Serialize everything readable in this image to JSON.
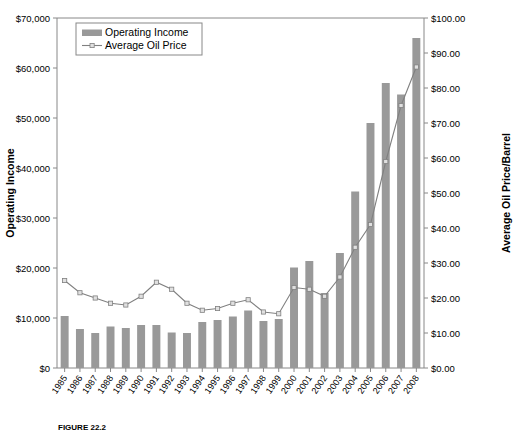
{
  "figure": {
    "caption": "FIGURE 22.2",
    "background_color": "#ffffff"
  },
  "chart_data": {
    "type": "bar",
    "title": "",
    "subtitle": "",
    "xlabel": "",
    "ylabel": "Operating Income",
    "y2label": "Average Oil Price/Barrel",
    "ylim": [
      0,
      70000
    ],
    "y2lim": [
      0,
      100
    ],
    "grid": false,
    "legend_position": "top-left",
    "categories": [
      "1985",
      "1986",
      "1987",
      "1988",
      "1989",
      "1990",
      "1991",
      "1992",
      "1993",
      "1994",
      "1995",
      "1996",
      "1997",
      "1998",
      "1999",
      "2000",
      "2001",
      "2002",
      "2003",
      "2004",
      "2005",
      "2006",
      "2007",
      "2008"
    ],
    "y_tick_labels": [
      "$0",
      "$10,000",
      "$20,000",
      "$30,000",
      "$40,000",
      "$50,000",
      "$60,000",
      "$70,000"
    ],
    "y_tick_values": [
      0,
      10000,
      20000,
      30000,
      40000,
      50000,
      60000,
      70000
    ],
    "y2_tick_labels": [
      "$0.00",
      "$10.00",
      "$20.00",
      "$30.00",
      "$40.00",
      "$50.00",
      "$60.00",
      "$70.00",
      "$80.00",
      "$90.00",
      "$100.00"
    ],
    "y2_tick_values": [
      0,
      10,
      20,
      30,
      40,
      50,
      60,
      70,
      80,
      90,
      100
    ],
    "series": [
      {
        "name": "Operating Income",
        "type": "bar",
        "axis": "left",
        "color": "#999999",
        "values": [
          10400,
          7800,
          7000,
          8300,
          8000,
          8600,
          8600,
          7100,
          7000,
          9200,
          9600,
          10300,
          11500,
          9400,
          9800,
          20100,
          21400,
          15000,
          23000,
          35300,
          49000,
          57000,
          54700,
          66000
        ]
      },
      {
        "name": "Average Oil Price",
        "type": "line",
        "axis": "right",
        "color": "#808080",
        "marker_color": "#e0e0e0",
        "values": [
          25.0,
          21.5,
          20.0,
          18.5,
          18.0,
          20.5,
          24.5,
          22.5,
          18.5,
          16.5,
          17.0,
          18.5,
          19.5,
          16.0,
          15.5,
          23.0,
          22.5,
          20.5,
          26.0,
          34.5,
          41.0,
          59.0,
          75.0,
          86.0
        ]
      }
    ]
  },
  "legend": {
    "items": [
      {
        "label": "Operating Income",
        "marker": "swatch",
        "color": "#999999"
      },
      {
        "label": "Average Oil Price",
        "marker": "line",
        "color": "#808080"
      }
    ]
  }
}
